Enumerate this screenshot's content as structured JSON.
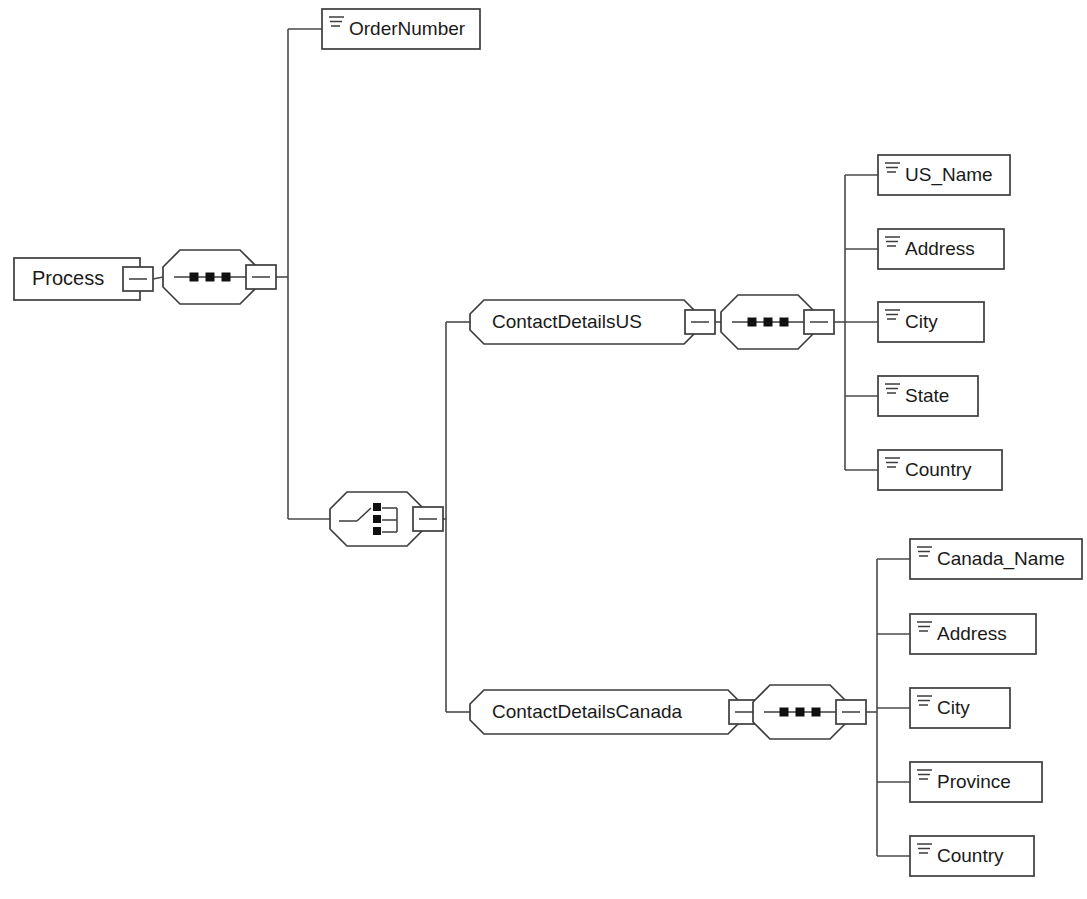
{
  "diagram": {
    "type": "xml-schema-tree",
    "title": "Process",
    "background_color": "#ffffff",
    "line_color": "#4a4a4a",
    "text_color": "#1a1a1a"
  },
  "root": {
    "label": "Process",
    "shape": "rectangle",
    "collapse_control": "minus",
    "x": 14,
    "y": 258,
    "w": 126,
    "h": 42
  },
  "root_compositor": {
    "kind": "sequence",
    "icon": "sequence-icon",
    "collapse_control": "minus",
    "cx": 210,
    "cy": 277
  },
  "order_number": {
    "label": "OrderNumber",
    "shape": "element-box",
    "icon": "attribute-lines-icon",
    "x": 322,
    "y": 9,
    "w": 158,
    "h": 40
  },
  "choice_compositor": {
    "kind": "choice",
    "icon": "choice-icon",
    "collapse_control": "minus",
    "cx": 377,
    "cy": 519
  },
  "branches": [
    {
      "name": "us",
      "node": {
        "label": "ContactDetailsUS",
        "shape": "octagon",
        "collapse_control": "minus",
        "x": 470,
        "y": 300,
        "w": 228,
        "h": 44
      },
      "compositor": {
        "kind": "sequence",
        "icon": "sequence-icon",
        "collapse_control": "minus",
        "cx": 768,
        "cy": 322
      },
      "elements": [
        {
          "label": "US_Name",
          "x": 878,
          "y": 155,
          "w": 132,
          "h": 40
        },
        {
          "label": "Address",
          "x": 878,
          "y": 229,
          "w": 126,
          "h": 40
        },
        {
          "label": "City",
          "x": 878,
          "y": 302,
          "w": 106,
          "h": 40
        },
        {
          "label": "State",
          "x": 878,
          "y": 376,
          "w": 100,
          "h": 40
        },
        {
          "label": "Country",
          "x": 878,
          "y": 450,
          "w": 124,
          "h": 40
        }
      ]
    },
    {
      "name": "canada",
      "node": {
        "label": "ContactDetailsCanada",
        "shape": "octagon",
        "collapse_control": "minus",
        "x": 470,
        "y": 690,
        "w": 272,
        "h": 44
      },
      "compositor": {
        "kind": "sequence",
        "icon": "sequence-icon",
        "collapse_control": "minus",
        "cx": 800,
        "cy": 712
      },
      "elements": [
        {
          "label": "Canada_Name",
          "x": 910,
          "y": 539,
          "w": 172,
          "h": 40
        },
        {
          "label": "Address",
          "x": 910,
          "y": 614,
          "w": 126,
          "h": 40
        },
        {
          "label": "City",
          "x": 910,
          "y": 688,
          "w": 100,
          "h": 40
        },
        {
          "label": "Province",
          "x": 910,
          "y": 762,
          "w": 132,
          "h": 40
        },
        {
          "label": "Country",
          "x": 910,
          "y": 836,
          "w": 124,
          "h": 40
        }
      ]
    }
  ]
}
